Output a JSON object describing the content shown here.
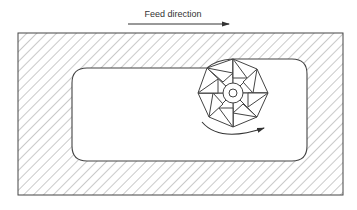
{
  "diagram": {
    "feed_label": "Feed direction",
    "colors": {
      "stroke": "#444444",
      "hatch": "#8a8a8a",
      "background": "#ffffff"
    },
    "elements": [
      {
        "id": "workpiece",
        "type": "hatched-rectangle"
      },
      {
        "id": "pocket",
        "type": "rounded-rectangle-cavity"
      },
      {
        "id": "cutter",
        "type": "milling-cutter",
        "teeth": 8
      },
      {
        "id": "rotation-arrow",
        "type": "curved-arrow",
        "direction": "counter-clockwise-sweep"
      },
      {
        "id": "feed-arrow",
        "type": "straight-arrow",
        "direction": "right"
      }
    ]
  }
}
